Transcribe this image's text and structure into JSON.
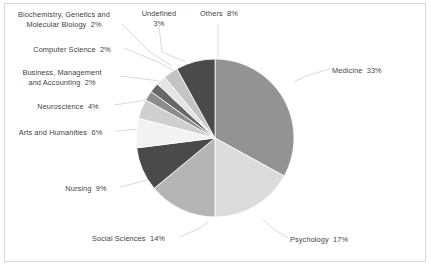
{
  "chart_data": {
    "type": "pie",
    "title": "",
    "legend_position": "callout-labels",
    "value_unit": "%",
    "total": 100,
    "categories": [
      "Medicine",
      "Psychology",
      "Social Sciences",
      "Nursing",
      "Arts and Humanities",
      "Neuroscience",
      "Business, Management and Accounting",
      "Computer Science",
      "Biochemistry, Genetics and Molecular Biology",
      "Undefined",
      "Others"
    ],
    "values": [
      33,
      17,
      14,
      9,
      6,
      4,
      2,
      2,
      2,
      3,
      8
    ],
    "colors": [
      "#939393",
      "#dcdcdc",
      "#b5b5b5",
      "#4a4a4a",
      "#f2f2f2",
      "#cfcfcf",
      "#8d8d8d",
      "#676767",
      "#e4e4e4",
      "#c4c4c4",
      "#4a4a4a"
    ],
    "start_angle_deg": 0,
    "direction": "clockwise",
    "slice_edge_color": "#ffffff"
  },
  "labels": [
    {
      "name": "biochemistry",
      "lines": [
        "Biochemistry, Genetics and",
        "Molecular Biology  2%"
      ],
      "text": "Biochemistry, Genetics and\nMolecular Biology  2%",
      "x": 6,
      "y": 10,
      "width": 116,
      "align": "center"
    },
    {
      "name": "computer-science",
      "lines": [
        "Computer Science  2%"
      ],
      "text": "Computer Science  2%",
      "x": 22,
      "y": 45,
      "width": 100,
      "align": "center"
    },
    {
      "name": "business-management",
      "lines": [
        "Business, Management",
        "and Accounting  2%"
      ],
      "text": "Business, Management\nand Accounting  2%",
      "x": 7,
      "y": 68,
      "width": 110,
      "align": "center"
    },
    {
      "name": "neuroscience",
      "lines": [
        "Neuroscience  4%"
      ],
      "text": "Neuroscience  4%",
      "x": 24,
      "y": 102,
      "width": 88,
      "align": "center"
    },
    {
      "name": "arts-and-humanities",
      "lines": [
        "Arts and Humanities  6%"
      ],
      "text": "Arts and Humanities  6%",
      "x": 8,
      "y": 128,
      "width": 105,
      "align": "center"
    },
    {
      "name": "nursing",
      "lines": [
        "Nursing  9%"
      ],
      "text": "Nursing  9%",
      "x": 54,
      "y": 184,
      "width": 64,
      "align": "center"
    },
    {
      "name": "social-sciences",
      "lines": [
        "Social Sciences  14%"
      ],
      "text": "Social Sciences  14%",
      "x": 80,
      "y": 234,
      "width": 97,
      "align": "center"
    },
    {
      "name": "psychology",
      "lines": [
        "Psychology  17%"
      ],
      "text": "Psychology  17%",
      "x": 290,
      "y": 235,
      "width": 84,
      "align": "left"
    },
    {
      "name": "medicine",
      "lines": [
        "Medicine  33%"
      ],
      "text": "Medicine  33%",
      "x": 332,
      "y": 66,
      "width": 78,
      "align": "left"
    },
    {
      "name": "undefined",
      "lines": [
        "Undefined",
        "3%"
      ],
      "text": "Undefined\n3%",
      "x": 130,
      "y": 9,
      "width": 58,
      "align": "center"
    },
    {
      "name": "others",
      "lines": [
        "Others  8%"
      ],
      "text": "Others  8%",
      "x": 188,
      "y": 9,
      "width": 62,
      "align": "center"
    }
  ],
  "geometry": {
    "center_x": 215,
    "center_y": 138,
    "radius": 79
  },
  "leaders": [
    {
      "name": "leader-biochemistry",
      "points": "122,24 150,52 172,66"
    },
    {
      "name": "leader-computer-science",
      "points": "124,48 158,62 176,72"
    },
    {
      "name": "leader-business",
      "points": "120,76 152,80 173,83"
    },
    {
      "name": "leader-neuroscience",
      "points": "114,105 148,100 168,99"
    },
    {
      "name": "leader-arts",
      "points": "116,131 140,129 150,128"
    },
    {
      "name": "leader-nursing",
      "points": "120,187 148,180 160,176"
    },
    {
      "name": "leader-social-sciences",
      "points": "180,237 200,228 208,222"
    },
    {
      "name": "leader-psychology",
      "points": "288,238 272,228 263,219"
    },
    {
      "name": "leader-medicine",
      "points": "330,69 306,76 294,82"
    },
    {
      "name": "leader-undefined",
      "points": "159,26 162,52 186,62"
    },
    {
      "name": "leader-others",
      "points": "218,24 218,45 218,59"
    }
  ]
}
